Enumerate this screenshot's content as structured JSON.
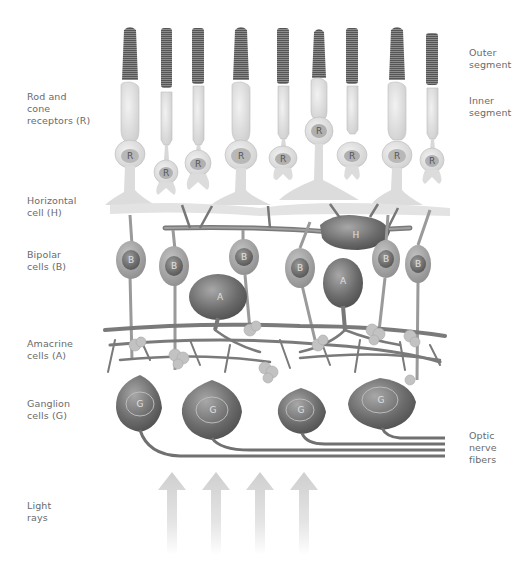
{
  "diagram": {
    "title_implied": "Retina cell layers",
    "left_labels": [
      {
        "id": "rod-cone",
        "text": "Rod and\ncone\nreceptors (R)"
      },
      {
        "id": "horizontal",
        "text": "Horizontal\ncell (H)"
      },
      {
        "id": "bipolar",
        "text": "Bipolar\ncells (B)"
      },
      {
        "id": "amacrine",
        "text": "Amacrine\ncells (A)"
      },
      {
        "id": "ganglion",
        "text": "Ganglion\ncells (G)"
      },
      {
        "id": "light",
        "text": "Light\nrays"
      }
    ],
    "right_labels": [
      {
        "id": "outer",
        "text": "Outer\nsegment"
      },
      {
        "id": "inner",
        "text": "Inner\nsegment"
      },
      {
        "id": "optic",
        "text": "Optic\nnerve\nfibers"
      }
    ],
    "cell_letters": {
      "receptor": "R",
      "horizontal": "H",
      "bipolar": "B",
      "amacrine": "A",
      "ganglion": "G"
    },
    "counts": {
      "receptors": 9,
      "horizontal": 1,
      "bipolar": 7,
      "amacrine": 2,
      "ganglion": 4,
      "light_arrows": 4
    },
    "colors": {
      "receptor_fill": "#e2e2e2",
      "outer_segment": "#707070",
      "neuron_dark": "#6e6e6e",
      "neuron_mid": "#9a9a9a",
      "fiber": "#7a7a7a",
      "arrow": "#d0d0d0",
      "label_text": "#6a6a6a"
    }
  }
}
